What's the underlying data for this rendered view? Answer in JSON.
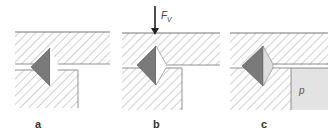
{
  "panels": [
    {
      "id": "a",
      "label": "a",
      "force": null,
      "pressure": null
    },
    {
      "id": "b",
      "label": "b",
      "force": "F",
      "force_sub": "V",
      "pressure": null
    },
    {
      "id": "c",
      "label": "c",
      "force": null,
      "pressure": "p"
    }
  ],
  "colors": {
    "hatch": "#9a9a9a",
    "cone_dark": "#7a7a7a",
    "cone_light": "#dedede",
    "pressure_fill": "#e3e3e3",
    "outline": "#777777"
  }
}
